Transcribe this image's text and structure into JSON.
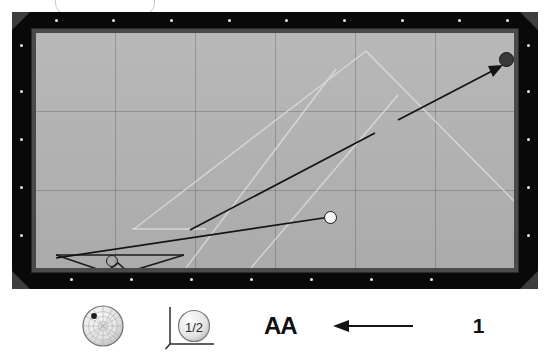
{
  "app": {
    "title": "Billiards Shot Diagram"
  },
  "top_chip": {
    "name": "rounded-chip",
    "label": ""
  },
  "table": {
    "felt_color": "#b4b4b4",
    "rail_color": "#090909",
    "bevel_color": "#4a4a4a",
    "diamond_color": "#e8e8e8",
    "top_rail_diamonds": 9,
    "bottom_rail_diamonds": 7,
    "left_rail_diamonds": 5,
    "right_rail_diamonds": 5,
    "grid_vertical_lines": 5,
    "grid_horizontal_lines": 2
  },
  "shot": {
    "cue_ball": {
      "label": "cue-ball",
      "x": 318,
      "y": 205,
      "color": "#f7f7f7"
    },
    "object_ball": {
      "label": "object-ball",
      "x": 494,
      "y": 47,
      "color": "#3a3a3a"
    },
    "ghost_ball": {
      "label": "ghost-ball",
      "x": 100,
      "y": 250
    },
    "cue_line": {
      "from_x": 44,
      "from_y": 243,
      "to_x": 318,
      "to_y": 205
    },
    "tangent_line": {
      "from_x": 178,
      "from_y": 218,
      "to_x": 363,
      "to_y": 121
    },
    "aim_arrow": {
      "from_x": 386,
      "from_y": 108,
      "to_x": 487,
      "to_y": 56
    },
    "wedge": {
      "label": "cue-stick-wedge"
    }
  },
  "toolbar": {
    "spin_indicator": {
      "name": "english-spin-indicator",
      "dot_position": "upper-left",
      "dot_x": 0.3,
      "dot_y": 0.28
    },
    "power_indicator": {
      "name": "cut-angle-indicator",
      "value": "1/2"
    },
    "text_tool": {
      "name": "text-size-tool",
      "label": "AA"
    },
    "arrow_tool": {
      "name": "arrow-direction-tool",
      "direction": "left"
    },
    "page_number": {
      "name": "page-number",
      "label": "1"
    }
  },
  "colors": {
    "felt": "#b4b4b4",
    "rail": "#090909",
    "ink": "#101010",
    "guide": "#ebebeb"
  }
}
